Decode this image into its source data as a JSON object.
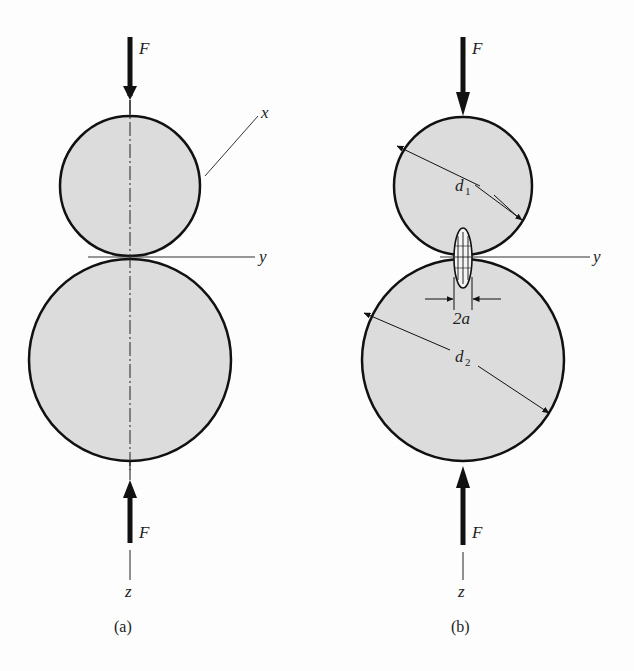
{
  "figure": {
    "panels": [
      {
        "id": "a",
        "caption": "(a)",
        "force_top": "F",
        "force_bottom": "F",
        "axis_x": "x",
        "axis_y": "y",
        "axis_z": "z"
      },
      {
        "id": "b",
        "caption": "(b)",
        "force_top": "F",
        "force_bottom": "F",
        "axis_y": "y",
        "axis_z": "z",
        "diameter_top": "d",
        "diameter_top_sub": "1",
        "diameter_bottom": "d",
        "diameter_bottom_sub": "2",
        "contact_width": "2a"
      }
    ],
    "colors": {
      "fill": "#dcdcdc",
      "stroke": "#111111",
      "background": "#fdfdfd"
    }
  }
}
